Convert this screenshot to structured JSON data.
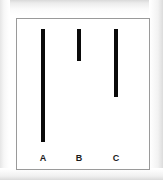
{
  "figure": {
    "background_color": "#ffffff",
    "frame_border_color": "#9a9a9a",
    "bar_color": "#0a0a0a",
    "label_color": "#1a1a1a",
    "frame": {
      "x": 16,
      "y": 18,
      "width": 134,
      "height": 152
    }
  },
  "chart_data": {
    "type": "bar",
    "orientation": "vertical-from-top",
    "title": "",
    "subtitle": "",
    "xlabel": "",
    "ylabel": "",
    "categories": [
      "A",
      "B",
      "C"
    ],
    "values": [
      113,
      32,
      68
    ],
    "value_unit": "px",
    "series": [
      {
        "name": "bar length",
        "values": [
          113,
          32,
          68
        ]
      }
    ],
    "bars": [
      {
        "label": "A",
        "length": 113,
        "center_x": 42,
        "top_y": 28,
        "bottom_y": 141,
        "width": 4,
        "color": "#0a0a0a",
        "rank": "longest"
      },
      {
        "label": "B",
        "length": 32,
        "center_x": 78,
        "top_y": 28,
        "bottom_y": 60,
        "width": 4,
        "color": "#0a0a0a",
        "rank": "shortest"
      },
      {
        "label": "C",
        "length": 68,
        "center_x": 115,
        "top_y": 28,
        "bottom_y": 96,
        "width": 4,
        "color": "#0a0a0a",
        "rank": "middle"
      }
    ],
    "tick_labels": [
      "A",
      "B",
      "C"
    ],
    "legend": [],
    "legend_position": "none",
    "grid": false,
    "axis_visible": false,
    "ylim": [
      0,
      152
    ],
    "annotations": []
  },
  "labels": {
    "a": "A",
    "b": "B",
    "c": "C"
  }
}
